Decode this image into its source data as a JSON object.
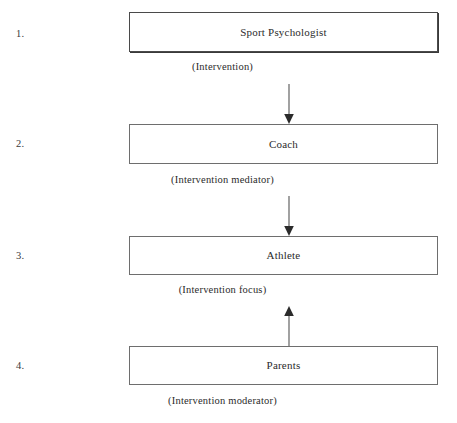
{
  "diagram": {
    "orientation": "vertical",
    "line_color": "#555555",
    "box_border_color": "#6e6e6e",
    "text_color": "#2b2b2b",
    "background_color": "#ffffff",
    "steps": [
      {
        "number": "1.",
        "box_label": "Sport Psychologist",
        "caption": "(Intervention)",
        "arrow_direction": "down"
      },
      {
        "number": "2.",
        "box_label": "Coach",
        "caption": "(Intervention mediator)",
        "arrow_direction": "down"
      },
      {
        "number": "3.",
        "box_label": "Athlete",
        "caption": "(Intervention focus)",
        "arrow_direction": "up"
      },
      {
        "number": "4.",
        "box_label": "Parents",
        "caption": "(Intervention moderator)",
        "arrow_direction": "none"
      }
    ]
  }
}
